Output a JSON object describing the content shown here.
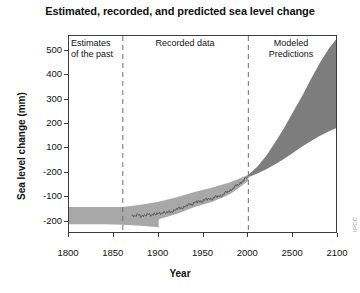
{
  "chart_data": {
    "type": "area",
    "title": "Estimated, recorded, and predicted sea level change",
    "xlabel": "Year",
    "ylabel": "Sea level change (mm)",
    "xlim": [
      1800,
      2100
    ],
    "ylim": [
      -250,
      560
    ],
    "grid": false,
    "legend": "none",
    "credit": "IPCC",
    "x_ticks": [
      {
        "value": 1800,
        "label": "1800"
      },
      {
        "value": 1850,
        "label": "1850"
      },
      {
        "value": 1900,
        "label": "1900"
      },
      {
        "value": 1950,
        "label": "1950"
      },
      {
        "value": 2000,
        "label": "2000"
      },
      {
        "value": 2050,
        "label": "2500"
      },
      {
        "value": 2100,
        "label": "2100"
      }
    ],
    "y_ticks": [
      {
        "value": 500,
        "label": "500"
      },
      {
        "value": 400,
        "label": "400"
      },
      {
        "value": 300,
        "label": "300"
      },
      {
        "value": 200,
        "label": "200"
      },
      {
        "value": 100,
        "label": "100"
      },
      {
        "value": 0,
        "label": "-200"
      },
      {
        "value": -100,
        "label": "-100"
      },
      {
        "value": -200,
        "label": "-200"
      }
    ],
    "panels": [
      {
        "id": "estimates",
        "label_line1": "Estimates",
        "label_line2": "of the past",
        "x_start": 1800,
        "x_end": 1860
      },
      {
        "id": "recorded",
        "label_line1": "Recorded data",
        "label_line2": "",
        "x_start": 1860,
        "x_end": 2000
      },
      {
        "id": "predictions",
        "label_line1": "Modeled",
        "label_line2": "Predictions",
        "x_start": 2000,
        "x_end": 2100
      }
    ],
    "dividers": [
      {
        "x": 1860,
        "style": "dashed"
      },
      {
        "x": 2000,
        "style": "dashed"
      }
    ],
    "series": [
      {
        "name": "Estimates of the past (uncertainty band)",
        "type": "band",
        "color": "#a8a8a8",
        "x": [
          1800,
          1820,
          1840,
          1860,
          1880,
          1900
        ],
        "upper": [
          -140,
          -140,
          -140,
          -140,
          -148,
          -160
        ],
        "lower": [
          -210,
          -210,
          -210,
          -212,
          -216,
          -222
        ]
      },
      {
        "name": "Recorded data (uncertainty band)",
        "type": "band",
        "color": "#a8a8a8",
        "x": [
          1860,
          1880,
          1900,
          1920,
          1940,
          1960,
          1980,
          2000
        ],
        "upper": [
          -140,
          -130,
          -118,
          -100,
          -78,
          -60,
          -38,
          -8
        ],
        "lower": [
          -212,
          -205,
          -190,
          -168,
          -140,
          -118,
          -86,
          -32
        ]
      },
      {
        "name": "Recorded data (tide gauge record)",
        "type": "line",
        "color": "#555555",
        "x": [
          1870,
          1875,
          1880,
          1885,
          1890,
          1895,
          1900,
          1905,
          1910,
          1915,
          1920,
          1925,
          1930,
          1935,
          1940,
          1945,
          1950,
          1955,
          1960,
          1965,
          1970,
          1975,
          1980,
          1985,
          1990,
          1995,
          2000
        ],
        "values": [
          -176,
          -172,
          -178,
          -170,
          -174,
          -166,
          -170,
          -160,
          -164,
          -156,
          -150,
          -142,
          -138,
          -128,
          -122,
          -118,
          -112,
          -108,
          -104,
          -98,
          -92,
          -82,
          -70,
          -58,
          -44,
          -30,
          -18
        ]
      },
      {
        "name": "Modeled Predictions (projection cone)",
        "type": "band",
        "color": "#7d7d7d",
        "x": [
          2000,
          2010,
          2020,
          2030,
          2040,
          2050,
          2060,
          2070,
          2080,
          2090,
          2100
        ],
        "upper": [
          -8,
          25,
          70,
          125,
          185,
          250,
          315,
          385,
          452,
          510,
          556
        ],
        "lower": [
          -18,
          -2,
          15,
          35,
          58,
          82,
          108,
          130,
          152,
          170,
          186
        ]
      }
    ]
  }
}
